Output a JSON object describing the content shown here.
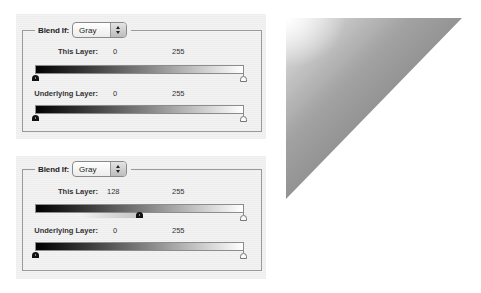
{
  "panels": [
    {
      "blend_if_label": "Blend If:",
      "channel_select": "Gray",
      "this_layer": {
        "label": "This Layer:",
        "black_value": "0",
        "white_value": "255"
      },
      "underlying_layer": {
        "label": "Underlying Layer:",
        "black_value": "0",
        "white_value": "255"
      }
    },
    {
      "blend_if_label": "Blend If:",
      "channel_select": "Gray",
      "this_layer": {
        "label": "This Layer:",
        "black_value": "128",
        "white_value": "255"
      },
      "underlying_layer": {
        "label": "Underlying Layer:",
        "black_value": "0",
        "white_value": "255"
      }
    }
  ],
  "preview": {
    "shape": "triangle-gradient",
    "gradient_colors": [
      "#ffffff",
      "#a2a2a2",
      "#7a7a7a"
    ]
  }
}
